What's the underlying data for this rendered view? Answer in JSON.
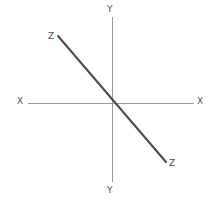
{
  "canvas": {
    "width": 218,
    "height": 204,
    "background": "#ffffff"
  },
  "chart_data": {
    "type": "line",
    "title": "",
    "subtitle": "",
    "xlabel": "X",
    "ylabel": "Y",
    "grid": false,
    "legend": "none",
    "origin": {
      "x": 112,
      "y": 103
    },
    "axes": [
      {
        "name": "x-axis",
        "label_start": "X",
        "label_end": "X",
        "x1": 28,
        "y1": 103,
        "x2": 194,
        "y2": 103,
        "color": "#9a9a9a",
        "width": 1
      },
      {
        "name": "y-axis",
        "label_start": "Y",
        "label_end": "Y",
        "x1": 112,
        "y1": 17,
        "x2": 112,
        "y2": 182,
        "color": "#9a9a9a",
        "width": 1
      }
    ],
    "series": [
      {
        "name": "Z",
        "label_start": "Z",
        "label_end": "Z",
        "x1": 58,
        "y1": 36,
        "x2": 166,
        "y2": 162,
        "color": "#4a4a4a",
        "width": 2,
        "slope": -1.167,
        "passes_through_origin": true
      }
    ],
    "labels": [
      {
        "id": "label-y-top",
        "text": "Y",
        "x": 111,
        "y": 10,
        "axis": "y",
        "end": "positive"
      },
      {
        "id": "label-y-bottom",
        "text": "Y",
        "x": 111,
        "y": 190,
        "axis": "y",
        "end": "negative"
      },
      {
        "id": "label-x-left",
        "text": "X",
        "x": 21,
        "y": 101,
        "axis": "x",
        "end": "negative"
      },
      {
        "id": "label-x-right",
        "text": "X",
        "x": 201,
        "y": 101,
        "axis": "x",
        "end": "positive"
      },
      {
        "id": "label-z-start",
        "text": "Z",
        "x": 53,
        "y": 37,
        "axis": "z",
        "end": "upper-left"
      },
      {
        "id": "label-z-end",
        "text": "Z",
        "x": 171,
        "y": 164,
        "axis": "z",
        "end": "lower-right"
      }
    ],
    "colors": {
      "axis": "#9a9a9a",
      "line": "#4a4a4a",
      "label": "#555555",
      "background": "#ffffff"
    }
  }
}
